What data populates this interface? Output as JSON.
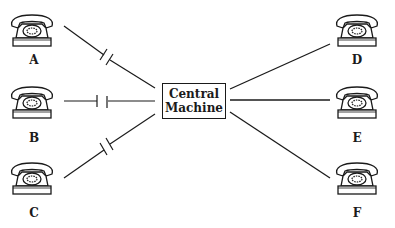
{
  "diagram": {
    "type": "telephone switching network",
    "center": {
      "line1": "Central",
      "line2": "Machine",
      "box": {
        "x": 162,
        "y": 83,
        "w": 64,
        "h": 36
      }
    },
    "colors": {
      "ink": "#1a1a1a",
      "background": "#ffffff"
    },
    "phones": [
      {
        "id": "A",
        "label": "A",
        "side": "left",
        "x": 8,
        "y": 12,
        "label_x": 34,
        "label_y": 53,
        "connection": "broken"
      },
      {
        "id": "B",
        "label": "B",
        "side": "left",
        "x": 8,
        "y": 84,
        "label_x": 34,
        "label_y": 131,
        "connection": "broken"
      },
      {
        "id": "C",
        "label": "C",
        "side": "left",
        "x": 8,
        "y": 160,
        "label_x": 34,
        "label_y": 206,
        "connection": "broken"
      },
      {
        "id": "D",
        "label": "D",
        "side": "right",
        "x": 333,
        "y": 12,
        "label_x": 357,
        "label_y": 53,
        "connection": "connected"
      },
      {
        "id": "E",
        "label": "E",
        "side": "right",
        "x": 333,
        "y": 84,
        "label_x": 357,
        "label_y": 131,
        "connection": "connected"
      },
      {
        "id": "F",
        "label": "F",
        "side": "right",
        "x": 333,
        "y": 160,
        "label_x": 357,
        "label_y": 206,
        "connection": "connected"
      }
    ]
  }
}
